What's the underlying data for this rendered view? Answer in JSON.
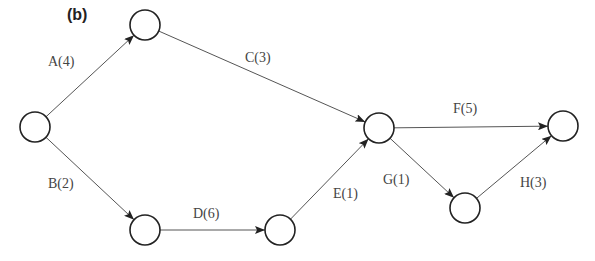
{
  "figure": {
    "label": "(b)"
  },
  "nodes": [
    {
      "id": "n1",
      "x": 35,
      "y": 127
    },
    {
      "id": "n2",
      "x": 145,
      "y": 25
    },
    {
      "id": "n3",
      "x": 145,
      "y": 230
    },
    {
      "id": "n4",
      "x": 280,
      "y": 230
    },
    {
      "id": "n5",
      "x": 379,
      "y": 128
    },
    {
      "id": "n6",
      "x": 465,
      "y": 208
    },
    {
      "id": "n7",
      "x": 563,
      "y": 126
    }
  ],
  "edges": [
    {
      "from": "n1",
      "to": "n2",
      "label": "A(4)"
    },
    {
      "from": "n1",
      "to": "n3",
      "label": "B(2)"
    },
    {
      "from": "n2",
      "to": "n5",
      "label": "C(3)"
    },
    {
      "from": "n3",
      "to": "n4",
      "label": "D(6)"
    },
    {
      "from": "n4",
      "to": "n5",
      "label": "E(1)"
    },
    {
      "from": "n5",
      "to": "n7",
      "label": "F(5)"
    },
    {
      "from": "n5",
      "to": "n6",
      "label": "G(1)"
    },
    {
      "from": "n6",
      "to": "n7",
      "label": "H(3)"
    }
  ]
}
